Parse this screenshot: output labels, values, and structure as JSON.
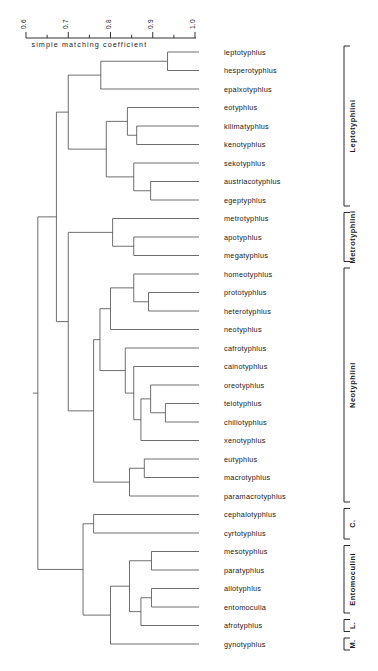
{
  "figure": {
    "kind": "dendrogram",
    "background_color": "#ffffff",
    "line_color": "#555555",
    "text_color": "#1a1a1a"
  },
  "axis": {
    "caption": "simple matching coefficient",
    "tick_labels": [
      "0.6",
      "0.7",
      "0.8",
      "0.9",
      "1.0"
    ],
    "tick_values": [
      0.6,
      0.7,
      0.8,
      0.9,
      1.0
    ],
    "minor_ticks": [
      0.65,
      0.75,
      0.85,
      0.95
    ],
    "label_rotation_deg": -90,
    "range": [
      0.6,
      1.0
    ],
    "orientation": "top"
  },
  "chart_data": {
    "type": "dendrogram",
    "title": "",
    "xlabel": "simple matching coefficient",
    "ylabel": "",
    "xlim": [
      0.6,
      1.0
    ],
    "grid": false,
    "legend": "none",
    "distance_metric": "simple matching coefficient",
    "leaves": [
      "leptotyphlus",
      "hesperotyphlus",
      "epalxotyphlus",
      "eotyphlus",
      "kilimatyphlus",
      "kenotyphlus",
      "sekotyphlus",
      "austriacotyphlus",
      "egeptyphlus",
      "metrotyphlus",
      "apotyphlus",
      "megatyphlus",
      "homeotyphlus",
      "prototyphlus",
      "heterotyphlus",
      "neotyphlus",
      "cafrotyphlus",
      "cainotyphlus",
      "oreotyphlus",
      "telotyphlus",
      "chiliotyphlus",
      "xenotyphlus",
      "eutyphlus",
      "macrotyphlus",
      "paramacrotyphlus",
      "cephalotyphlus",
      "cyrtotyphlus",
      "mesotyphlus",
      "paratyphlus",
      "allotyphlus",
      "entomoculia",
      "afrotyphlus",
      "gynotyphlus"
    ],
    "groups": [
      {
        "label": "Leptotyphlini",
        "first_leaf": 0,
        "last_leaf": 8,
        "display": "full"
      },
      {
        "label": "Metrotyphlini",
        "first_leaf": 9,
        "last_leaf": 11,
        "display": "full"
      },
      {
        "label": "Neotyphlini",
        "first_leaf": 12,
        "last_leaf": 24,
        "display": "full"
      },
      {
        "label": "C.",
        "first_leaf": 25,
        "last_leaf": 26,
        "display": "short"
      },
      {
        "label": "Entomoculini",
        "first_leaf": 27,
        "last_leaf": 30,
        "display": "full"
      },
      {
        "label": "L.",
        "first_leaf": 31,
        "last_leaf": 31,
        "display": "short"
      },
      {
        "label": "M.",
        "first_leaf": 32,
        "last_leaf": 32,
        "display": "short"
      }
    ],
    "merges": [
      {
        "id": "m1",
        "children": [
          "leptotyphlus",
          "hesperotyphlus"
        ],
        "similarity": 0.935
      },
      {
        "id": "m2",
        "children": [
          "m1",
          "epalxotyphlus"
        ],
        "similarity": 0.777
      },
      {
        "id": "m3",
        "children": [
          "kilimatyphlus",
          "kenotyphlus"
        ],
        "similarity": 0.862
      },
      {
        "id": "m4",
        "children": [
          "eotyphlus",
          "m3"
        ],
        "similarity": 0.84
      },
      {
        "id": "m5",
        "children": [
          "austriacotyphlus",
          "egeptyphlus"
        ],
        "similarity": 0.895
      },
      {
        "id": "m6",
        "children": [
          "sekotyphlus",
          "m5"
        ],
        "similarity": 0.855
      },
      {
        "id": "m7",
        "children": [
          "m4",
          "m6"
        ],
        "similarity": 0.79
      },
      {
        "id": "m8",
        "children": [
          "m2",
          "m7"
        ],
        "similarity": 0.7
      },
      {
        "id": "m9",
        "children": [
          "apotyphlus",
          "megatyphlus"
        ],
        "similarity": 0.855
      },
      {
        "id": "m10",
        "children": [
          "metrotyphlus",
          "m9"
        ],
        "similarity": 0.805
      },
      {
        "id": "m11",
        "children": [
          "prototyphlus",
          "heterotyphlus"
        ],
        "similarity": 0.89
      },
      {
        "id": "m12",
        "children": [
          "homeotyphlus",
          "m11"
        ],
        "similarity": 0.855
      },
      {
        "id": "m13",
        "children": [
          "m12",
          "neotyphlus"
        ],
        "similarity": 0.8
      },
      {
        "id": "m14",
        "children": [
          "telotyphlus",
          "chiliotyphlus"
        ],
        "similarity": 0.93
      },
      {
        "id": "m15",
        "children": [
          "oreotyphlus",
          "m14"
        ],
        "similarity": 0.895
      },
      {
        "id": "m16",
        "children": [
          "m15",
          "xenotyphlus"
        ],
        "similarity": 0.872
      },
      {
        "id": "m17",
        "children": [
          "cainotyphlus",
          "m16"
        ],
        "similarity": 0.855
      },
      {
        "id": "m18",
        "children": [
          "cafrotyphlus",
          "m17"
        ],
        "similarity": 0.835
      },
      {
        "id": "m19",
        "children": [
          "m13",
          "m18"
        ],
        "similarity": 0.775
      },
      {
        "id": "m20",
        "children": [
          "eutyphlus",
          "macrotyphlus"
        ],
        "similarity": 0.88
      },
      {
        "id": "m21",
        "children": [
          "m20",
          "paramacrotyphlus"
        ],
        "similarity": 0.845
      },
      {
        "id": "m22",
        "children": [
          "m19",
          "m21"
        ],
        "similarity": 0.76
      },
      {
        "id": "m23",
        "children": [
          "m10",
          "m22"
        ],
        "similarity": 0.7
      },
      {
        "id": "m24",
        "children": [
          "m8",
          "m23"
        ],
        "similarity": 0.672
      },
      {
        "id": "m25",
        "children": [
          "cephalotyphlus",
          "cyrtotyphlus"
        ],
        "similarity": 0.76
      },
      {
        "id": "m26",
        "children": [
          "mesotyphlus",
          "paratyphlus"
        ],
        "similarity": 0.897
      },
      {
        "id": "m27",
        "children": [
          "allotyphlus",
          "entomoculia"
        ],
        "similarity": 0.897
      },
      {
        "id": "m28",
        "children": [
          "m27",
          "afrotyphlus"
        ],
        "similarity": 0.872
      },
      {
        "id": "m29",
        "children": [
          "m26",
          "m28"
        ],
        "similarity": 0.845
      },
      {
        "id": "m30",
        "children": [
          "m29",
          "gynotyphlus"
        ],
        "similarity": 0.8
      },
      {
        "id": "m31",
        "children": [
          "m25",
          "m30"
        ],
        "similarity": 0.735
      },
      {
        "id": "m32",
        "children": [
          "m24",
          "m31"
        ],
        "similarity": 0.628
      }
    ]
  }
}
